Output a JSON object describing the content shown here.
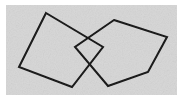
{
  "figure": {
    "width": 184,
    "height": 101,
    "background_color": "#d6d6d6",
    "paper_margin_color": "#ffffff",
    "stroke_color": "#1a1a1a",
    "stroke_width": 2,
    "shapes": [
      {
        "name": "left-quadrilateral",
        "sides": 4,
        "points": "46,13 103,47 72,87 19,67",
        "vertices": [
          {
            "label": "top",
            "x": 46,
            "y": 13
          },
          {
            "label": "right",
            "x": 103,
            "y": 47
          },
          {
            "label": "bottom",
            "x": 72,
            "y": 87
          },
          {
            "label": "left",
            "x": 19,
            "y": 67
          }
        ]
      },
      {
        "name": "right-quadrilateral",
        "sides": 4,
        "points": "114,20 167,37 148,72 108,86 75,47",
        "vertices": [
          {
            "label": "top",
            "x": 114,
            "y": 20
          },
          {
            "label": "right",
            "x": 167,
            "y": 37
          },
          {
            "label": "bottom-right",
            "x": 148,
            "y": 72
          },
          {
            "label": "bottom-left",
            "x": 108,
            "y": 86
          },
          {
            "label": "left",
            "x": 75,
            "y": 47
          }
        ]
      }
    ],
    "margins": {
      "left": 6,
      "top": 5,
      "right": 7,
      "bottom": 6
    }
  }
}
